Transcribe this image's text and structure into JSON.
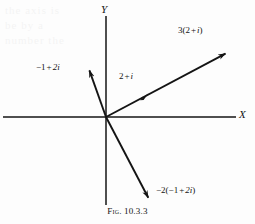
{
  "figure": {
    "caption_prefix": "Fig.",
    "caption_number": "10.3.3",
    "background_color": "#fdfdfd",
    "ink_color": "#141414"
  },
  "axes": {
    "x_label": "X",
    "y_label": "Y",
    "origin": {
      "x": 106,
      "y": 117
    },
    "x_start": {
      "x": 3,
      "y": 117
    },
    "x_end": {
      "x": 236,
      "y": 117
    },
    "y_top": {
      "x": 106,
      "y": 16
    },
    "y_bottom": {
      "x": 106,
      "y": 205
    }
  },
  "vectors": [
    {
      "name": "vector-3-times-2-plus-i",
      "label_parts": {
        "coefficient": "3(2",
        "plus": "+",
        "imaginary": "i",
        "close": ")"
      },
      "label_text": "3(2 + i)",
      "from": {
        "x": 106,
        "y": 117
      },
      "to": {
        "x": 228,
        "y": 52
      },
      "label_pos": {
        "x": 178,
        "y": 30
      }
    },
    {
      "name": "vector-2-plus-i",
      "label_parts": {
        "real": "2",
        "plus": "+",
        "imaginary": "i"
      },
      "label_text": "2 + i",
      "from": {
        "x": 106,
        "y": 117
      },
      "to": {
        "x": 147,
        "y": 95
      },
      "label_pos": {
        "x": 119,
        "y": 76
      }
    },
    {
      "name": "vector-minus-1-plus-2i",
      "label_parts": {
        "real": "−1",
        "plus": "+",
        "imaginary": "2i"
      },
      "label_text": "−1 + 2i",
      "from": {
        "x": 106,
        "y": 117
      },
      "to": {
        "x": 88,
        "y": 68
      },
      "label_pos": {
        "x": 36,
        "y": 68
      }
    },
    {
      "name": "vector-minus-2-times-minus-1-plus-2i",
      "label_parts": {
        "coefficient": "−2(−1",
        "plus": "+",
        "imaginary": "2i",
        "close": ")"
      },
      "label_text": "−2(−1 + 2i)",
      "from": {
        "x": 106,
        "y": 117
      },
      "to": {
        "x": 150,
        "y": 201
      },
      "label_pos": {
        "x": 156,
        "y": 191
      }
    }
  ],
  "bleed_text": {
    "lines": [
      "the  axis  is",
      "be  by  a",
      "number  the"
    ]
  }
}
